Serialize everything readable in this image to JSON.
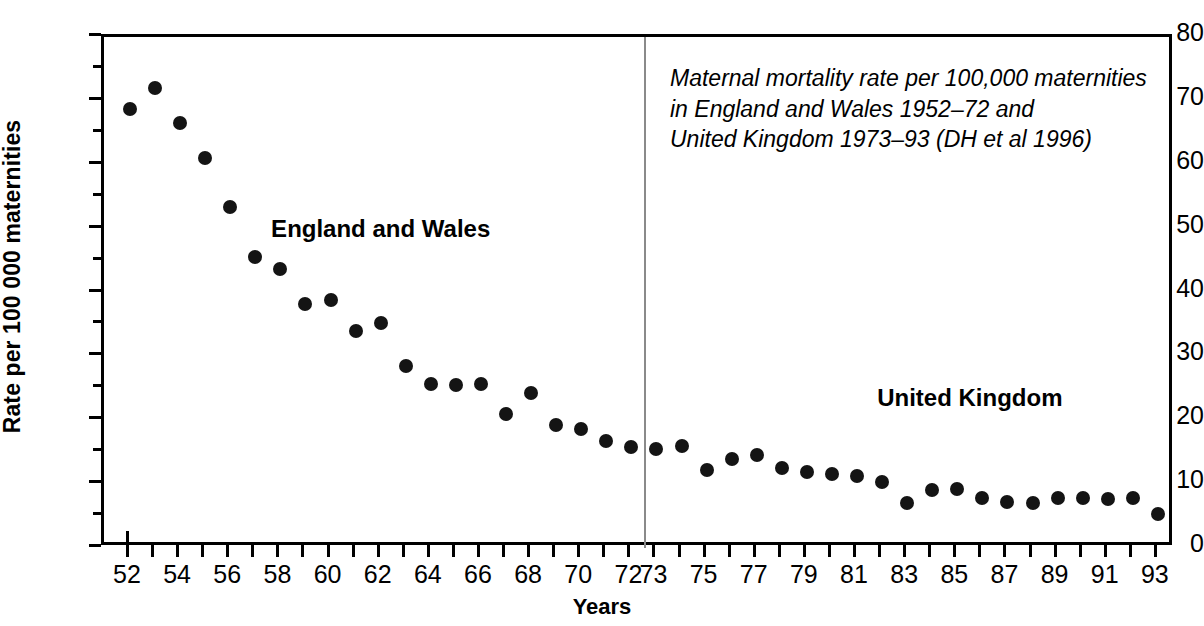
{
  "chart_data": {
    "type": "scatter",
    "title": "",
    "xlabel": "Years",
    "ylabel": "Rate per 100 000 maternities",
    "ylim": [
      0,
      80
    ],
    "xlim": [
      52,
      93
    ],
    "y_major_ticks": [
      0,
      10,
      20,
      30,
      40,
      50,
      60,
      70,
      80
    ],
    "y_minor_ticks": [
      5,
      15,
      25,
      35,
      45,
      55,
      65,
      75
    ],
    "x_ticks": [
      52,
      53,
      54,
      55,
      56,
      57,
      58,
      59,
      60,
      61,
      62,
      63,
      64,
      65,
      66,
      67,
      68,
      69,
      70,
      71,
      72,
      73,
      74,
      75,
      76,
      77,
      78,
      79,
      80,
      81,
      82,
      83,
      84,
      85,
      86,
      87,
      88,
      89,
      90,
      91,
      92,
      93
    ],
    "x_tick_labels": [
      "52",
      "",
      "54",
      "",
      "56",
      "",
      "58",
      "",
      "60",
      "",
      "62",
      "",
      "64",
      "",
      "66",
      "",
      "68",
      "",
      "70",
      "",
      "72",
      "73",
      "",
      "75",
      "",
      "77",
      "",
      "79",
      "",
      "81",
      "",
      "83",
      "",
      "85",
      "",
      "87",
      "",
      "89",
      "",
      "91",
      "",
      "93"
    ],
    "grid": false,
    "legend_position": "inline-annotation",
    "marker_color": "#141414",
    "divider_x": 72.5,
    "divider_color": "#8a8a8a",
    "series": [
      {
        "name": "England and Wales",
        "label_x": 62.0,
        "label_y": 50.0,
        "x": [
          52,
          53,
          54,
          55,
          56,
          57,
          58,
          59,
          60,
          61,
          62,
          63,
          64,
          65,
          66,
          67,
          68,
          69,
          70,
          71,
          72
        ],
        "values": [
          68.8,
          72.0,
          66.6,
          61.1,
          53.4,
          45.5,
          43.7,
          38.2,
          38.9,
          33.9,
          35.3,
          28.5,
          25.6,
          25.5,
          25.6,
          21.0,
          24.2,
          19.3,
          18.7,
          16.8,
          15.8
        ]
      },
      {
        "name": "United Kingdom",
        "label_x": 85.5,
        "label_y": 23.5,
        "x": [
          73,
          74,
          75,
          76,
          77,
          78,
          79,
          80,
          81,
          82,
          83,
          84,
          85,
          86,
          87,
          88,
          89,
          90,
          91,
          92,
          93
        ],
        "values": [
          15.5,
          15.9,
          12.2,
          13.9,
          14.6,
          12.6,
          11.9,
          11.6,
          11.3,
          10.3,
          7.1,
          9.1,
          9.2,
          7.9,
          7.2,
          7.1,
          7.8,
          7.9,
          7.7,
          7.8,
          5.3
        ]
      }
    ],
    "caption_lines": [
      "Maternal mortality rate per 100,000 maternities",
      "in England and Wales 1952–72 and",
      "United Kingdom 1973–93 (DH et al 1996)"
    ],
    "caption_x": 667,
    "caption_y": 60
  }
}
